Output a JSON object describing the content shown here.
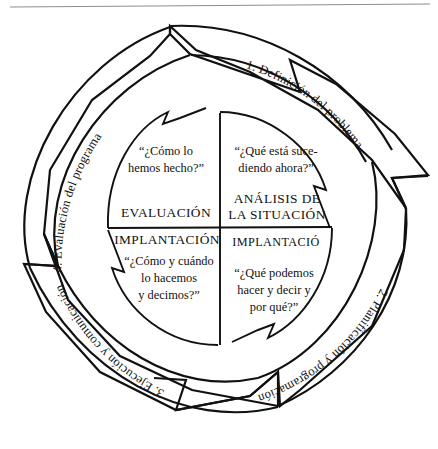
{
  "diagram": {
    "type": "cyclical-process",
    "colors": {
      "stroke": "#111111",
      "background": "#ffffff",
      "page_rule": "#8d8d8d"
    },
    "outer_steps": [
      {
        "id": "step-1",
        "label": "1. Definición del problema",
        "position": "upper-right"
      },
      {
        "id": "step-2",
        "label": "2. Planificación y programación",
        "position": "lower-right"
      },
      {
        "id": "step-3",
        "label": "3. Ejecución y comunicación",
        "position": "lower-left"
      },
      {
        "id": "step-4",
        "label": "4. Evaluación del programa",
        "position": "upper-left"
      }
    ],
    "quadrants": [
      {
        "id": "quadrant-analysis",
        "position": "upper-right",
        "heading_line1": "ANÁLISIS DE",
        "heading_line2": "LA SITUACIÓN",
        "question_line1": "“¿Qué está suce-",
        "question_line2": "diendo ahora?”"
      },
      {
        "id": "quadrant-evaluation",
        "position": "upper-left",
        "heading_line1": "EVALUACIÓN",
        "heading_line2": "",
        "question_line1": "“¿Cómo lo",
        "question_line2": "hemos hecho?”"
      },
      {
        "id": "quadrant-implantation-left",
        "position": "lower-left",
        "heading_line1": "IMPLANTACIÓN",
        "heading_line2": "",
        "question_line1": "“¿Cómo y cuándo",
        "question_line2": "lo hacemos",
        "question_line3": "y decimos?”"
      },
      {
        "id": "quadrant-implantation-right",
        "position": "lower-right",
        "heading_line1": "IMPLANTACIÓ",
        "heading_line2": "",
        "question_line1": "“¿Qué podemos",
        "question_line2": "hacer y decir y",
        "question_line3": "por qué?”"
      }
    ]
  }
}
